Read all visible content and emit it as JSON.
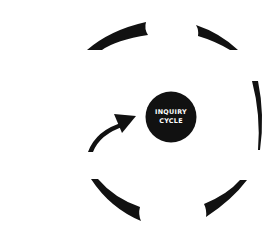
{
  "diagram": {
    "center": {
      "line1": "INQUIRY",
      "line2": "CYCLE",
      "fill": "#111111",
      "text_color": "#ffffff"
    },
    "ring": {
      "segments": [
        "top-left-arc",
        "top-right-arc",
        "right-arc",
        "bottom-right-arc",
        "bottom-left-arc"
      ],
      "color": "#111111"
    },
    "arrow": {
      "direction": "toward-center",
      "color": "#111111"
    },
    "background": "#ffffff"
  }
}
